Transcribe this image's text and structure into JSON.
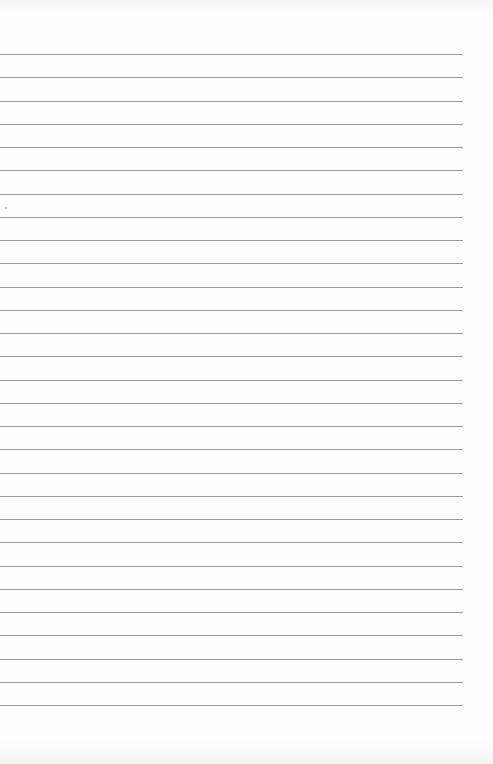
{
  "page": {
    "type": "lined-paper",
    "background_color": "#fdfdfd",
    "line_color": "#9a9a9a",
    "line_count": 29,
    "first_line_y": 54,
    "line_spacing": 23.25,
    "line_width": 463
  }
}
